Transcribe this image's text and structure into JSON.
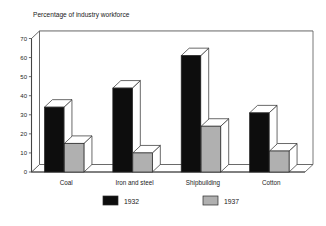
{
  "chart_data": {
    "type": "bar",
    "title": "Percentage of industry workforce",
    "xlabel": "",
    "ylabel": "",
    "ylim": [
      0,
      70
    ],
    "ytick_step": 10,
    "yticks": [
      "0",
      "10",
      "20",
      "30",
      "40",
      "50",
      "60",
      "70"
    ],
    "grid": true,
    "legend_position": "bottom",
    "three_d": true,
    "categories": [
      "Coal",
      "Iron and steel",
      "Shipbuilding",
      "Cotton"
    ],
    "series": [
      {
        "name": "1932",
        "color": "#0d0d0d",
        "values": [
          34,
          44,
          61,
          31
        ]
      },
      {
        "name": "1937",
        "color": "#b0b0b0",
        "values": [
          15,
          10,
          24,
          11
        ]
      }
    ]
  },
  "legend": {
    "items": [
      {
        "label": "1932",
        "swatch": "#0d0d0d"
      },
      {
        "label": "1937",
        "swatch": "#b0b0b0"
      }
    ]
  },
  "colors": {
    "background": "#ffffff",
    "frame": "#555555",
    "gridline": "#a8a8a8",
    "series_1932": "#0d0d0d",
    "series_1937": "#b0b0b0",
    "bar_top": "#ffffff",
    "bar_side": "#ffffff",
    "bar_outline": "#2a2a2a"
  }
}
